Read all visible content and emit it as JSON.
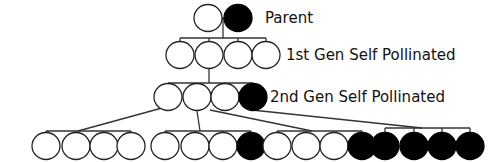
{
  "diagram": {
    "legend_colors": {
      "dominant_trait": "#ffffff",
      "recessive_trait": "#000000"
    },
    "labels": {
      "parent": "Parent",
      "gen1": "1st Gen Self Pollinated",
      "gen2": "2nd Gen Self Pollinated"
    },
    "parent": [
      "open",
      "filled"
    ],
    "gen1": [
      "open",
      "open",
      "open",
      "open"
    ],
    "gen2": [
      "open",
      "open",
      "open",
      "filled"
    ],
    "gen3_groups": [
      {
        "from_gen2_index": 0,
        "children": [
          "open",
          "open",
          "open",
          "open"
        ]
      },
      {
        "from_gen2_index": 1,
        "children": [
          "open",
          "open",
          "open",
          "filled"
        ]
      },
      {
        "from_gen2_index": 2,
        "children": [
          "open",
          "open",
          "open",
          "filled"
        ]
      },
      {
        "from_gen2_index": 3,
        "children": [
          "filled",
          "filled",
          "filled",
          "filled"
        ]
      }
    ]
  }
}
